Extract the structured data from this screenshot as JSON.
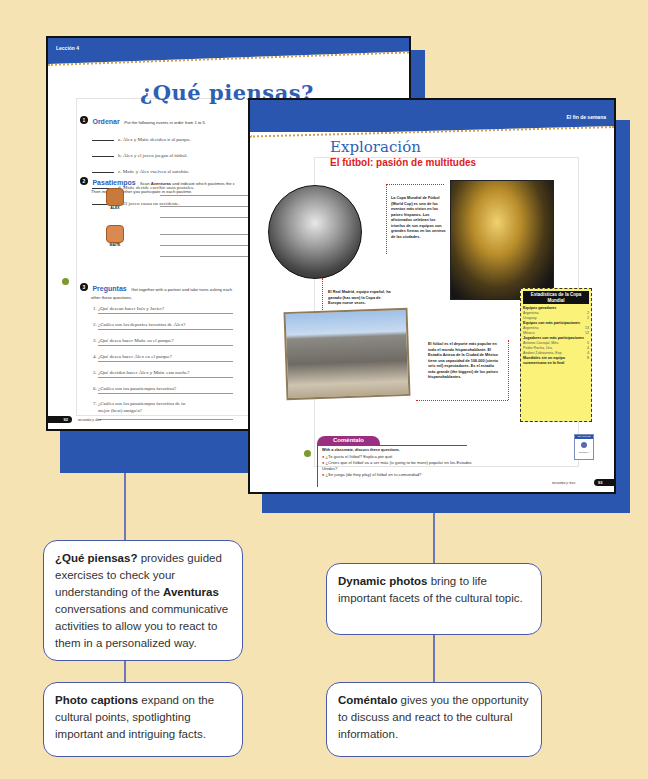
{
  "left_page": {
    "header": "Lección 4",
    "title": "¿Qué piensas?",
    "page_number": "92",
    "page_words": "noventa y dos",
    "exercise1": {
      "num": "1",
      "title": "Ordenar",
      "instructions": "Put the following events in order from 1 to 5.",
      "items": [
        "a. Álex y Maite deciden ir al parque.",
        "b. Álex y el joven juegan al fútbol.",
        "c. Maite y Álex vuelven al autobús.",
        "d. Maite decide escribir unas postales.",
        "e. El joven causa un accidente."
      ]
    },
    "exercise2": {
      "num": "2",
      "title": "Pasatiempos",
      "instructions_a": "Scan ",
      "instructions_bold": "Aventuras",
      "instructions_b": " and indicate which pastimes the c",
      "instructions_line2": "Then indicate whether you participate in each pastime.",
      "people": [
        "ALEX",
        "MAITE"
      ]
    },
    "exercise3": {
      "num": "3",
      "title": "Preguntas",
      "instructions": "Get together with a partner and take turns asking each",
      "instructions_line2": "other these questions.",
      "questions": [
        "1. ¿Qué desean hacer Inés y Javier?",
        "2. ¿Cuáles son los deportes favoritos de Álex?",
        "3. ¿Qué desea hacer Maite en el parque?",
        "4. ¿Qué desea hacer Álex en el parque?",
        "5. ¿Qué deciden hacer Álex y Maite esta noche?",
        "6. ¿Cuáles son tus pasatiempos favoritos?",
        "7. ¿Cuáles son los pasatiempos favoritos de tu",
        "mejor (best) amigo/a?"
      ]
    }
  },
  "right_page": {
    "header": "El fin de semana",
    "title": "Exploración",
    "subtitle": "El fútbol: pasión de multitudes",
    "page_number": "93",
    "page_words": "noventa y tres",
    "caption_worldcup": "La Copa Mundial de Fútbol (World Cup) es uno de los eventos más vistos en los países hispanos. Los aficionados celebran los triunfos de sus equipos con grandes fiestas en los centros de las ciudades.",
    "caption_madrid": "El Real Madrid, equipo español, ha ganado (has won) la Copa de Europa nueve veces.",
    "caption_stadium": "El fútbol es el deporte más popular en todo el mundo hispanohablante. El Estadio Azteca de la Ciudad de México tiene una capacidad de 106.000 (ciento seis mil) espectadores. Es el estadio más grande (the biggest) de los países hispanohablantes.",
    "stats": {
      "title": "Estadísticas de la Copa Mundial",
      "sections": [
        {
          "heading": "Equipos ganadores",
          "rows": [
            [
              "Argentina",
              "2"
            ],
            [
              "Uruguay",
              "2"
            ]
          ]
        },
        {
          "heading": "Equipos con más participaciones",
          "rows": [
            [
              "Argentina",
              "13"
            ],
            [
              "México",
              "12"
            ]
          ]
        },
        {
          "heading": "Jugadores con más participaciones",
          "rows": [
            [
              "Antonio Carvajal, Méx.",
              "5"
            ],
            [
              "Pedro Rocha, Uru.",
              "4"
            ],
            [
              "Andoni Zubizarreta, Esp.",
              "4"
            ]
          ]
        },
        {
          "heading": "Mundiales sin un equipo suramericano en la final",
          "rows": [
            [
              "",
              "8"
            ]
          ]
        }
      ]
    },
    "comentalo": {
      "tab": "Coméntalo",
      "intro": "With a classmate, discuss these questions.",
      "questions": [
        "¿Te gusta el fútbol? Explica por qué.",
        "¿Crees que el fútbol va a ser más (is going to be more) popular en los Estados Unidos?",
        "¿Se juega (do they play) el fútbol en tu comunidad?"
      ]
    },
    "badge": {
      "label": "PRACTICE",
      "text": "Lección 4"
    }
  },
  "callouts": [
    {
      "bold": "¿Qué piensas?",
      "text": " provides guided exercises to check your understanding of the ",
      "bold2": "Aventuras",
      "text2": " conversations and communicative activities to allow you to react to them in a personalized way."
    },
    {
      "bold": "Photo captions",
      "text": " expand on the cultural points, spotlighting important and intriguing facts."
    },
    {
      "bold": "Dynamic photos",
      "text": " bring to life important facets of the cultural topic."
    },
    {
      "bold": "Coméntalo",
      "text": " gives you the opportunity to discuss and react to the cultural information."
    }
  ],
  "colors": {
    "background": "#f6e3b4",
    "blue": "#2a56b0",
    "red": "#e02020",
    "purple": "#9a2f82",
    "stats_yellow": "#fbf27a"
  }
}
